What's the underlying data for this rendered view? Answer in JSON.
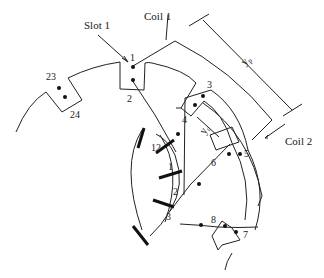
{
  "labels": {
    "slot1": "Slot 1",
    "coil1": "Coil 1",
    "coil2": "Coil 2",
    "pole_pitch": "y",
    "pole_pitch_sub": "p",
    "commutator_pitch": "y",
    "commutator_pitch_sub": "c"
  },
  "slot_numbers": [
    "1",
    "2",
    "3",
    "4",
    "5",
    "6",
    "7",
    "8",
    "23",
    "24"
  ],
  "commutator_segments": [
    "12",
    "1",
    "2",
    "3"
  ],
  "colors": {
    "line": "#222222",
    "background": "#ffffff"
  }
}
